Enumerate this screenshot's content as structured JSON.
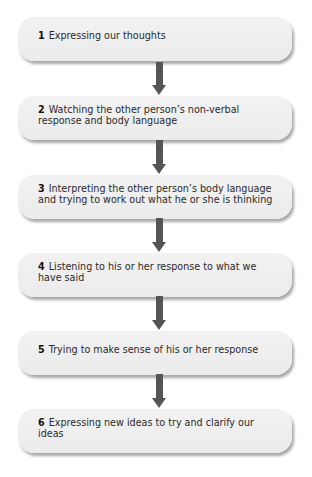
{
  "diagram": {
    "type": "flowchart",
    "direction": "top-to-bottom",
    "colors": {
      "box_fill": "#eeeeee",
      "arrow": "#555555",
      "text": "#2a2a2a"
    },
    "steps": [
      {
        "number": "1",
        "text": "Expressing our thoughts"
      },
      {
        "number": "2",
        "text": "Watching the other person’s non-verbal response and body language"
      },
      {
        "number": "3",
        "text": "Interpreting the other person’s body language and trying to work out what he or she is thinking"
      },
      {
        "number": "4",
        "text": "Listening to his or her response to what we have said"
      },
      {
        "number": "5",
        "text": "Trying to make sense of his or her response"
      },
      {
        "number": "6",
        "text": "Expressing new ideas to try and clarify our ideas"
      }
    ],
    "connectors": [
      {
        "from": "1",
        "to": "2",
        "icon": "down-arrow-icon"
      },
      {
        "from": "2",
        "to": "3",
        "icon": "down-arrow-icon"
      },
      {
        "from": "3",
        "to": "4",
        "icon": "down-arrow-icon"
      },
      {
        "from": "4",
        "to": "5",
        "icon": "down-arrow-icon"
      },
      {
        "from": "5",
        "to": "6",
        "icon": "down-arrow-icon"
      }
    ]
  }
}
